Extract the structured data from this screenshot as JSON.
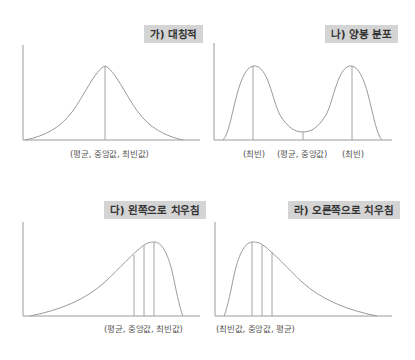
{
  "figure": {
    "panels": [
      {
        "id": "symmetric",
        "title": "가) 대칭적",
        "captions": [
          "(평균,  중앙값,  최빈값)"
        ]
      },
      {
        "id": "bimodal",
        "title": "나) 양봉 분포",
        "captions": [
          "(최빈)",
          "(평균, 중앙값)",
          "(최빈)"
        ]
      },
      {
        "id": "left-skewed",
        "title": "다) 왼쪽으로 치우침",
        "captions": [
          "(평균, 중앙값, 최빈값)"
        ]
      },
      {
        "id": "right-skewed",
        "title": "라) 오른쪽으로 치우침",
        "captions": [
          "(최빈값, 중앙값, 평균)"
        ]
      }
    ],
    "colors": {
      "title_bg": "#d4d4d4",
      "title_text": "#333333",
      "line": "#9a9a9a",
      "caption_text": "#555555"
    }
  }
}
